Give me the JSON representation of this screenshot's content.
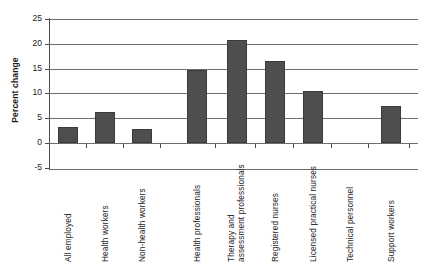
{
  "chart_data": {
    "type": "bar",
    "title": "",
    "xlabel": "",
    "ylabel": "Percent change",
    "ylim": [
      -5,
      25
    ],
    "yticks": [
      -5,
      0,
      5,
      10,
      15,
      20,
      25
    ],
    "ytick_labels": [
      "-5",
      "0",
      "5",
      "10",
      "15",
      "20",
      "25"
    ],
    "grid": true,
    "legend": "none",
    "bar_color": "#4e4e4e",
    "categories": [
      "All employed",
      "Health workers",
      "Non-health workers",
      "Health professionals",
      "Therapy and assessment professionals",
      "Registered nurses",
      "Licensed practical nurses",
      "Technical personnel",
      "Support workers"
    ],
    "category_lines": [
      [
        "All employed"
      ],
      [
        "Health workers"
      ],
      [
        "Non-health workers"
      ],
      [
        "Health professionals"
      ],
      [
        "Therapy and",
        "assessment professionals"
      ],
      [
        "Registered nurses"
      ],
      [
        "Licensed practical nurses"
      ],
      [
        "Technical personnel"
      ],
      [
        "Support workers"
      ]
    ],
    "values": [
      3.2,
      6.3,
      2.8,
      14.8,
      20.8,
      16.6,
      10.5,
      0.0,
      7.5
    ]
  }
}
